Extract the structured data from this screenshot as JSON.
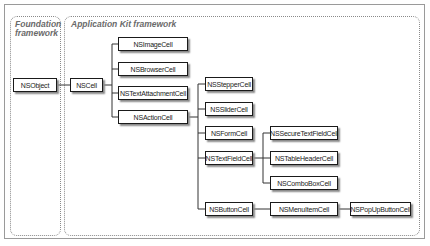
{
  "regions": {
    "foundation": {
      "title_line1": "Foundation",
      "title_line2": "framework"
    },
    "appkit": {
      "title": "Application Kit framework"
    }
  },
  "classes": {
    "nsobject": "NSObject",
    "nscell": "NSCell",
    "nsimagecell": "NSImageCell",
    "nsbrowsercell": "NSBrowserCell",
    "nstextattachmentcell": "NSTextAttachmentCell",
    "nsactioncell": "NSActionCell",
    "nsteppercell": "NSStepperCell",
    "nsslidercell": "NSSliderCell",
    "nsformcell": "NSFormCell",
    "nstextfieldcell": "NSTextFieldCell",
    "nsbuttoncell": "NSButtonCell",
    "nssecuretextfieldcell": "NSSecureTextFieldCell",
    "nstableheadercell": "NSTableHeaderCell",
    "nscomboboxcell": "NSComboBoxCell",
    "nsmenuitemcell": "NSMenuItemCell",
    "nspopupbuttoncell": "NSPopUpButtonCell"
  },
  "hierarchy": [
    {
      "parent": "NSObject",
      "children": [
        "NSCell"
      ]
    },
    {
      "parent": "NSCell",
      "children": [
        "NSImageCell",
        "NSBrowserCell",
        "NSTextAttachmentCell",
        "NSActionCell"
      ]
    },
    {
      "parent": "NSActionCell",
      "children": [
        "NSStepperCell",
        "NSSliderCell",
        "NSFormCell",
        "NSTextFieldCell",
        "NSButtonCell"
      ]
    },
    {
      "parent": "NSTextFieldCell",
      "children": [
        "NSSecureTextFieldCell",
        "NSTableHeaderCell",
        "NSComboBoxCell"
      ]
    },
    {
      "parent": "NSButtonCell",
      "children": [
        "NSMenuItemCell"
      ]
    },
    {
      "parent": "NSMenuItemCell",
      "children": [
        "NSPopUpButtonCell"
      ]
    }
  ]
}
